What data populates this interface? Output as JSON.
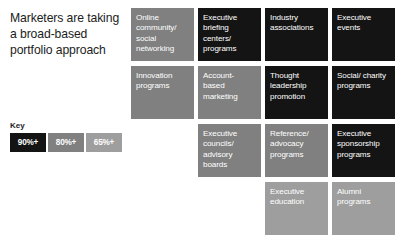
{
  "headline": "Marketers are taking a broad-based portfolio approach",
  "legend": {
    "title": "Key",
    "items": [
      {
        "label": "90%+",
        "color": "#141414"
      },
      {
        "label": "80%+",
        "color": "#808080"
      },
      {
        "label": "65%+",
        "color": "#9e9e9e"
      }
    ]
  },
  "colors": {
    "background": "#ffffff",
    "tile_90": "#141414",
    "tile_80": "#808080",
    "tile_65": "#9e9e9e",
    "tile_text": "#ffffff",
    "headline_text": "#1c1c1c"
  },
  "grid": {
    "columns": 4,
    "rows": 4,
    "cells": [
      {
        "label": "Online community/ social networking",
        "tier": "80%+",
        "color": "#808080",
        "row": 1,
        "col": 1
      },
      {
        "label": "Executive briefing centers/ programs",
        "tier": "90%+",
        "color": "#141414",
        "row": 1,
        "col": 2
      },
      {
        "label": "Industry associations",
        "tier": "90%+",
        "color": "#141414",
        "row": 1,
        "col": 3
      },
      {
        "label": "Executive events",
        "tier": "90%+",
        "color": "#141414",
        "row": 1,
        "col": 4
      },
      {
        "label": "Innovation programs",
        "tier": "80%+",
        "color": "#808080",
        "row": 2,
        "col": 1
      },
      {
        "label": "Account- based marketing",
        "tier": "80%+",
        "color": "#808080",
        "row": 2,
        "col": 2
      },
      {
        "label": "Thought leadership promotion",
        "tier": "90%+",
        "color": "#141414",
        "row": 2,
        "col": 3
      },
      {
        "label": "Social/ charity programs",
        "tier": "90%+",
        "color": "#141414",
        "row": 2,
        "col": 4
      },
      {
        "label": "",
        "tier": "",
        "color": "transparent",
        "row": 3,
        "col": 1
      },
      {
        "label": "Executive councils/ advisory boards",
        "tier": "80%+",
        "color": "#808080",
        "row": 3,
        "col": 2
      },
      {
        "label": "Reference/ advocacy programs",
        "tier": "80%+",
        "color": "#808080",
        "row": 3,
        "col": 3
      },
      {
        "label": "Executive sponsorship programs",
        "tier": "90%+",
        "color": "#141414",
        "row": 3,
        "col": 4
      },
      {
        "label": "",
        "tier": "",
        "color": "transparent",
        "row": 4,
        "col": 1
      },
      {
        "label": "",
        "tier": "",
        "color": "transparent",
        "row": 4,
        "col": 2
      },
      {
        "label": "Executive education",
        "tier": "65%+",
        "color": "#9e9e9e",
        "row": 4,
        "col": 3
      },
      {
        "label": "Alumni programs",
        "tier": "65%+",
        "color": "#9e9e9e",
        "row": 4,
        "col": 4
      }
    ]
  }
}
